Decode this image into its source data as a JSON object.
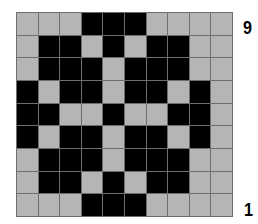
{
  "pattern": {
    "columns": 10,
    "rows": 9,
    "colors": {
      "filled": "#000000",
      "empty": "#b5b5b5",
      "gridline": "#6e6e6e"
    },
    "cells": [
      [
        0,
        0,
        0,
        1,
        1,
        1,
        0,
        0,
        0,
        0
      ],
      [
        0,
        1,
        1,
        0,
        1,
        0,
        1,
        1,
        0,
        0
      ],
      [
        0,
        1,
        1,
        1,
        0,
        1,
        1,
        1,
        0,
        0
      ],
      [
        1,
        0,
        1,
        1,
        0,
        1,
        1,
        0,
        1,
        0
      ],
      [
        1,
        1,
        0,
        0,
        1,
        0,
        0,
        1,
        1,
        0
      ],
      [
        1,
        0,
        1,
        1,
        0,
        1,
        1,
        0,
        1,
        0
      ],
      [
        0,
        1,
        1,
        1,
        0,
        1,
        1,
        1,
        0,
        0
      ],
      [
        0,
        1,
        1,
        0,
        1,
        0,
        1,
        1,
        0,
        0
      ],
      [
        0,
        0,
        0,
        1,
        1,
        1,
        0,
        0,
        0,
        0
      ]
    ]
  },
  "labels": {
    "top_row_number": "9",
    "bottom_row_number": "1"
  }
}
